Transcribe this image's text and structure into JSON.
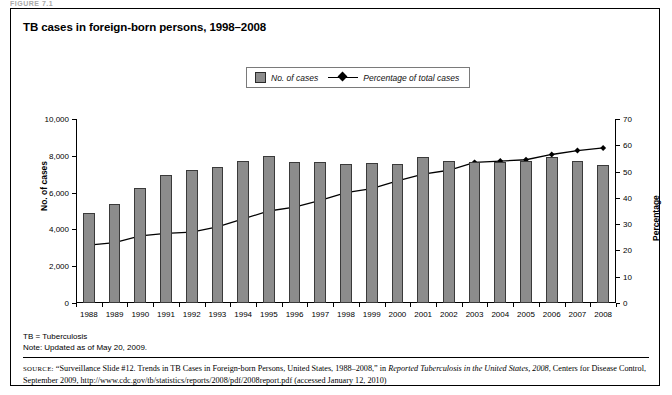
{
  "figure_label": "FIGURE 7.1",
  "title": "TB cases in foreign-born persons, 1998–2008",
  "legend": {
    "bars_label": "No. of cases",
    "line_label": "Percentage of total cases"
  },
  "axes": {
    "left_title": "No. of cases",
    "right_title": "Percentage",
    "left_ticks": [
      "0",
      "2,000",
      "4,000",
      "6,000",
      "8,000",
      "10,000"
    ],
    "right_ticks": [
      "0",
      "10",
      "20",
      "30",
      "40",
      "50",
      "60",
      "70"
    ]
  },
  "notes": {
    "abbrev": "TB = Tuberculosis",
    "updated": "Note: Updated as of May 20, 2009."
  },
  "source": {
    "label": "SOURCE:",
    "part1": "“Surveillance Slide #12. Trends in TB Cases in Foreign-born Persons, United States, 1988–2008,” in ",
    "italic1": "Reported Tuberculosis in the United States, 2008",
    "part2": ", Centers for Disease Control, September 2009, http://www.cdc.gov/tb/statistics/reports/2008/pdf/2008report.pdf (accessed January 12, 2010)"
  },
  "colors": {
    "bar_fill": "#8c8c8c",
    "bar_stroke": "#3a3a3a",
    "line": "#000000",
    "frame": "#000000"
  },
  "chart_data": {
    "type": "bar",
    "title": "TB cases in foreign-born persons, 1998–2008",
    "xlabel": "",
    "ylabel": "No. of cases",
    "y2label": "Percentage",
    "ylim": [
      0,
      10000
    ],
    "y2lim": [
      0,
      70
    ],
    "grid": false,
    "legend_position": "top-center",
    "categories": [
      "1988",
      "1989",
      "1990",
      "1991",
      "1992",
      "1993",
      "1994",
      "1995",
      "1996",
      "1997",
      "1998",
      "1999",
      "2000",
      "2001",
      "2002",
      "2003",
      "2004",
      "2005",
      "2006",
      "2007",
      "2008"
    ],
    "series": [
      {
        "name": "No. of cases",
        "type": "bar",
        "axis": "left",
        "values": [
          4900,
          5400,
          6250,
          6950,
          7250,
          7400,
          7700,
          7980,
          7650,
          7680,
          7580,
          7620,
          7550,
          7920,
          7700,
          7650,
          7650,
          7700,
          7950,
          7700,
          7500
        ]
      },
      {
        "name": "Percentage of total cases",
        "type": "line",
        "axis": "right",
        "values": [
          22.0,
          23.0,
          25.5,
          26.5,
          27.0,
          29.0,
          32.0,
          35.0,
          36.5,
          39.0,
          42.0,
          43.5,
          46.5,
          49.0,
          50.5,
          53.5,
          54.0,
          54.5,
          56.5,
          58.0,
          59.0
        ]
      }
    ]
  }
}
